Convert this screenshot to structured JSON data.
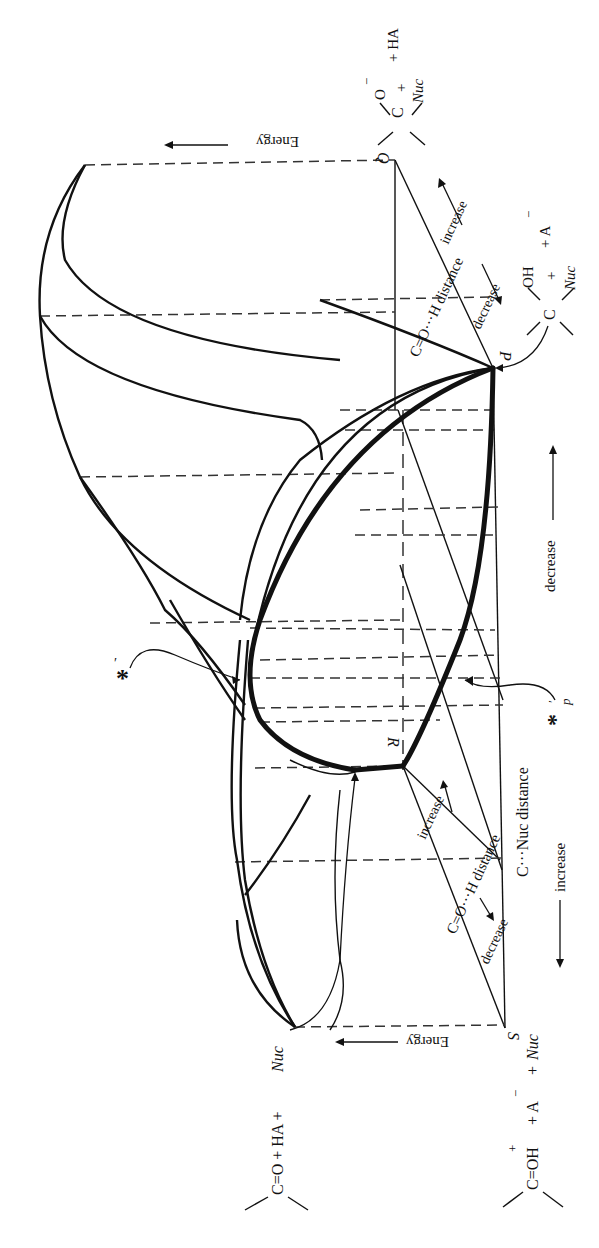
{
  "figure": {
    "orientation": "rotated 90deg clockwise (read with page turned)",
    "corners": {
      "P": "P",
      "Q": "Q",
      "R": "R",
      "S": "S"
    },
    "axes": {
      "energy_top": "Energy",
      "energy_bottom": "Energy",
      "co_h_distance_top": "C=O···H distance",
      "co_h_distance_top_increase": "increase",
      "co_h_distance_top_decrease": "decrease",
      "co_h_distance_bottom": "C=O···H distance",
      "co_h_distance_bottom_increase": "increase",
      "co_h_distance_bottom_decrease": "decrease",
      "c_nuc_distance": "C···Nuc distance",
      "c_nuc_increase": "increase",
      "c_nuc_decrease": "decrease"
    },
    "species": {
      "top_right": {
        "atom": "C",
        "sub_o": "O",
        "charge": "−",
        "plus": "+",
        "nuc": "Nuc",
        "rest": "+ HA"
      },
      "mid_right": {
        "atom": "C",
        "sub_oh": "OH",
        "plus": "+",
        "nuc": "Nuc",
        "rest": "+ A",
        "charge": "−"
      },
      "bottom_right": {
        "lead": "C=OH",
        "plus_charge": "+",
        "rest1": "+ A",
        "charge": "−",
        "rest2": "+",
        "nuc": "Nuc"
      },
      "bottom_left": {
        "lead": "C=O + HA +",
        "nuc": "Nuc"
      }
    },
    "markers": {
      "transition_state": "*",
      "transition_state_prime": "′",
      "projected_ts": "*",
      "projected_ts_sub": "p",
      "projected_ts_prime": "′"
    },
    "colors": {
      "ink": "#111111",
      "dash": "#333333",
      "background": "#ffffff"
    }
  }
}
